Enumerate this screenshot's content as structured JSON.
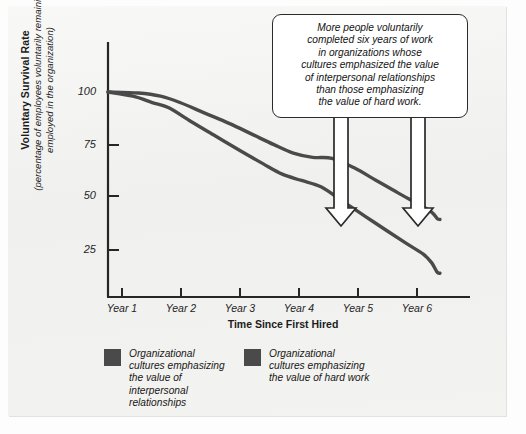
{
  "chart_data": {
    "type": "line",
    "title": "",
    "xlabel": "Time Since First Hired",
    "ylabel_main": "Voluntary Survival Rate",
    "ylabel_sub": "(percentage of employees voluntarily remaining employed in the organization)",
    "xtick_labels": [
      "Year 1",
      "Year 2",
      "Year 3",
      "Year 4",
      "Year 5",
      "Year 6"
    ],
    "ytick_labels": [
      "100",
      "75",
      "50",
      "25"
    ],
    "ytick_values": [
      100,
      75,
      50,
      25
    ],
    "ylim": [
      0,
      112
    ],
    "xlim": [
      0.0,
      6.4
    ],
    "grid": false,
    "legend_position": "below-plot",
    "line_color": "#4a4a4a",
    "swatch_color": "#4a4a4a",
    "axis_color": "#262626",
    "series": [
      {
        "name": "Organizational cultures emphasizing the value of interpersonal relationships",
        "x": [
          0.0,
          0.55,
          0.95,
          1.3,
          1.75,
          2.2,
          2.6,
          3.0,
          3.35,
          3.7,
          4.05,
          4.45,
          4.85,
          5.25,
          5.6,
          5.85,
          5.95,
          6.0
        ],
        "values": [
          100,
          99.5,
          98,
          95,
          90,
          85,
          80,
          75,
          71,
          69,
          68.5,
          64,
          58,
          52,
          47,
          43,
          40,
          39.5
        ]
      },
      {
        "name": "Organizational cultures emphasizing the value of hard work",
        "x": [
          0.0,
          0.45,
          0.8,
          1.1,
          1.5,
          1.95,
          2.4,
          2.8,
          3.15,
          3.5,
          3.85,
          4.25,
          4.65,
          5.05,
          5.4,
          5.7,
          5.85,
          5.95,
          6.0
        ],
        "values": [
          100,
          98,
          95,
          92.5,
          86,
          79,
          72,
          66,
          61,
          58,
          55,
          48,
          41,
          34,
          28,
          23,
          19,
          14.5,
          14
        ]
      }
    ],
    "annotations": {
      "callout_lines": [
        "More people voluntarily",
        "completed six years of work",
        "in organizations whose",
        "cultures emphasized the value",
        "of interpersonal relationships",
        "than those emphasizing",
        "the value of hard work."
      ],
      "arrows": [
        {
          "name": "arrow-to-hard-work-curve",
          "target_series": "Organizational cultures emphasizing the value of hard work"
        },
        {
          "name": "arrow-to-interpersonal-curve",
          "target_series": "Organizational cultures emphasizing the value of interpersonal relationships"
        }
      ]
    },
    "legend": [
      {
        "label_lines": [
          "Organizational",
          "cultures emphasizing",
          "the value of",
          "interpersonal",
          "relationships"
        ],
        "color": "#4a4a4a"
      },
      {
        "label_lines": [
          "Organizational",
          "cultures emphasizing",
          "the value of hard work"
        ],
        "color": "#4a4a4a"
      }
    ]
  }
}
